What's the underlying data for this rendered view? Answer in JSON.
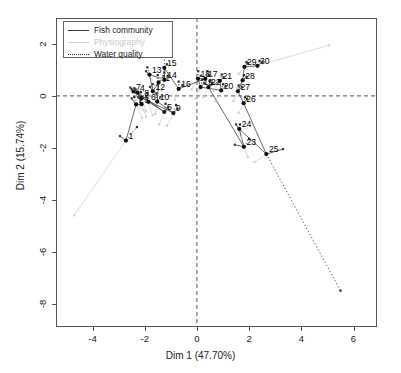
{
  "title": "",
  "axes": {
    "xlabel": "Dim 1 (47.70%)",
    "ylabel": "Dim 2 (15.74%)",
    "xticks": [
      -4,
      -2,
      0,
      2,
      4,
      6
    ],
    "yticks": [
      2,
      0,
      -2,
      -4,
      -6,
      -8
    ],
    "xlim": [
      -5.4,
      6.9
    ],
    "ylim": [
      -8.9,
      3.0
    ],
    "ref_lines": {
      "vertical_x": 0,
      "horizontal_y": 0,
      "style": "dashed"
    }
  },
  "legend": {
    "position": "top-left",
    "items": [
      {
        "label": "Fish community",
        "color": "#3a3a3a",
        "style": "solid"
      },
      {
        "label": "Physiography",
        "color": "#d2d2d2",
        "style": "solid"
      },
      {
        "label": "Water quality",
        "color": "#2b2b2b",
        "style": "dotted"
      }
    ]
  },
  "chart_data": {
    "type": "scatter",
    "title": "",
    "xlabel": "Dim 1 (47.70%)",
    "ylabel": "Dim 2 (15.74%)",
    "xlim": [
      -5.4,
      6.9
    ],
    "ylim": [
      -8.9,
      3.0
    ],
    "grid": false,
    "legend_position": "top-left",
    "series": [
      {
        "name": "Individuals (global)",
        "style": "labelled-points",
        "color": "#111111",
        "points": [
          {
            "label": "1",
            "x": -2.72,
            "y": -1.72
          },
          {
            "label": "2",
            "x": -2.33,
            "y": -0.33
          },
          {
            "label": "3",
            "x": -2.12,
            "y": -0.32
          },
          {
            "label": "4",
            "x": -2.28,
            "y": 0.13
          },
          {
            "label": "5",
            "x": -1.25,
            "y": -0.62
          },
          {
            "label": "6",
            "x": -1.86,
            "y": -0.23
          },
          {
            "label": "7",
            "x": -2.43,
            "y": 0.17
          },
          {
            "label": "8",
            "x": -2.12,
            "y": -0.08
          },
          {
            "label": "9",
            "x": -0.9,
            "y": -0.66
          },
          {
            "label": "10",
            "x": -1.52,
            "y": -0.22
          },
          {
            "label": "11",
            "x": -1.47,
            "y": 0.52
          },
          {
            "label": "12",
            "x": -1.69,
            "y": 0.18
          },
          {
            "label": "13",
            "x": -1.82,
            "y": 0.82
          },
          {
            "label": "14",
            "x": -1.24,
            "y": 0.62
          },
          {
            "label": "15",
            "x": -1.25,
            "y": 1.08
          },
          {
            "label": "16",
            "x": -0.7,
            "y": 0.27
          },
          {
            "label": "17",
            "x": 0.32,
            "y": 0.66
          },
          {
            "label": "18",
            "x": 0.04,
            "y": 0.66
          },
          {
            "label": "19",
            "x": 0.14,
            "y": 0.34
          },
          {
            "label": "20",
            "x": 0.93,
            "y": 0.21
          },
          {
            "label": "21",
            "x": 0.88,
            "y": 0.58
          },
          {
            "label": "22",
            "x": 0.44,
            "y": 0.34
          },
          {
            "label": "23",
            "x": 1.8,
            "y": -1.96
          },
          {
            "label": "24",
            "x": 1.62,
            "y": -1.27
          },
          {
            "label": "25",
            "x": 2.66,
            "y": -2.24
          },
          {
            "label": "26",
            "x": 1.79,
            "y": -0.28
          },
          {
            "label": "27",
            "x": 1.57,
            "y": 0.18
          },
          {
            "label": "28",
            "x": 1.75,
            "y": 0.6
          },
          {
            "label": "29",
            "x": 1.82,
            "y": 1.12
          },
          {
            "label": "30",
            "x": 2.32,
            "y": 1.16
          }
        ]
      },
      {
        "name": "Fish community",
        "style": "solid",
        "color": "#3a3a3a",
        "partial_points": [
          {
            "id": "1",
            "x": -2.95,
            "y": -1.55
          },
          {
            "id": "2",
            "x": -2.5,
            "y": -0.1
          },
          {
            "id": "3",
            "x": -2.25,
            "y": -0.05
          },
          {
            "id": "4",
            "x": -2.4,
            "y": 0.3
          },
          {
            "id": "5",
            "x": -1.1,
            "y": -0.45
          },
          {
            "id": "6",
            "x": -1.95,
            "y": 0.0
          },
          {
            "id": "7",
            "x": -2.55,
            "y": 0.32
          },
          {
            "id": "8",
            "x": -2.25,
            "y": 0.1
          },
          {
            "id": "9",
            "x": -0.75,
            "y": -0.5
          },
          {
            "id": "10",
            "x": -1.4,
            "y": -0.05
          },
          {
            "id": "11",
            "x": -1.32,
            "y": 0.68
          },
          {
            "id": "12",
            "x": -1.8,
            "y": 0.35
          },
          {
            "id": "13",
            "x": -1.95,
            "y": 0.95
          },
          {
            "id": "14",
            "x": -1.1,
            "y": 0.78
          },
          {
            "id": "15",
            "x": -1.15,
            "y": 1.22
          },
          {
            "id": "16",
            "x": -0.55,
            "y": 0.42
          },
          {
            "id": "17",
            "x": 0.45,
            "y": 0.8
          },
          {
            "id": "18",
            "x": 0.15,
            "y": 0.78
          },
          {
            "id": "19",
            "x": 0.28,
            "y": 0.5
          },
          {
            "id": "20",
            "x": 1.1,
            "y": 0.38
          },
          {
            "id": "21",
            "x": 1.02,
            "y": 0.72
          },
          {
            "id": "22",
            "x": 0.58,
            "y": 0.48
          },
          {
            "id": "23",
            "x": 1.45,
            "y": -1.88
          },
          {
            "id": "24",
            "x": 1.5,
            "y": -1.1
          },
          {
            "id": "25",
            "x": 3.3,
            "y": -2.05
          },
          {
            "id": "26",
            "x": 1.92,
            "y": -0.12
          },
          {
            "id": "27",
            "x": 1.72,
            "y": 0.34
          },
          {
            "id": "28",
            "x": 1.9,
            "y": 0.74
          },
          {
            "id": "29",
            "x": 1.95,
            "y": 1.26
          },
          {
            "id": "30",
            "x": 2.5,
            "y": 1.3
          }
        ]
      },
      {
        "name": "Physiography",
        "style": "solid",
        "color": "#d2d2d2",
        "partial_points": [
          {
            "id": "1",
            "x": -4.7,
            "y": -4.6
          },
          {
            "id": "2",
            "x": -2.1,
            "y": -0.85
          },
          {
            "id": "3",
            "x": -1.95,
            "y": -0.8
          },
          {
            "id": "4",
            "x": -2.05,
            "y": -0.55
          },
          {
            "id": "5",
            "x": -1.45,
            "y": -1.1
          },
          {
            "id": "6",
            "x": -1.7,
            "y": -0.75
          },
          {
            "id": "7",
            "x": -2.2,
            "y": -0.45
          },
          {
            "id": "8",
            "x": -1.95,
            "y": -0.6
          },
          {
            "id": "9",
            "x": -1.15,
            "y": -1.15
          },
          {
            "id": "10",
            "x": -1.6,
            "y": -0.7
          },
          {
            "id": "11",
            "x": -1.6,
            "y": 0.1
          },
          {
            "id": "12",
            "x": -1.55,
            "y": -0.25
          },
          {
            "id": "13",
            "x": -1.6,
            "y": 0.4
          },
          {
            "id": "14",
            "x": -1.35,
            "y": 0.2
          },
          {
            "id": "15",
            "x": -1.35,
            "y": 0.65
          },
          {
            "id": "16",
            "x": -0.85,
            "y": -0.15
          },
          {
            "id": "17",
            "x": 0.1,
            "y": 0.25
          },
          {
            "id": "18",
            "x": -0.2,
            "y": 0.25
          },
          {
            "id": "19",
            "x": -0.05,
            "y": -0.1
          },
          {
            "id": "20",
            "x": 0.7,
            "y": -0.2
          },
          {
            "id": "21",
            "x": 0.65,
            "y": 0.2
          },
          {
            "id": "22",
            "x": 0.25,
            "y": -0.05
          },
          {
            "id": "23",
            "x": 1.95,
            "y": -2.35
          },
          {
            "id": "24",
            "x": 1.7,
            "y": -1.6
          },
          {
            "id": "25",
            "x": 2.2,
            "y": -2.55
          },
          {
            "id": "26",
            "x": 1.6,
            "y": -0.65
          },
          {
            "id": "27",
            "x": 1.4,
            "y": -0.2
          },
          {
            "id": "28",
            "x": 1.55,
            "y": 0.3
          },
          {
            "id": "29",
            "x": 1.6,
            "y": 0.85
          },
          {
            "id": "30",
            "x": 5.05,
            "y": 1.95
          }
        ]
      },
      {
        "name": "Water quality",
        "style": "dotted",
        "color": "#2b2b2b",
        "partial_points": [
          {
            "id": "1",
            "x": -2.3,
            "y": -1.2
          },
          {
            "id": "2",
            "x": -2.4,
            "y": -0.05
          },
          {
            "id": "3",
            "x": -2.15,
            "y": -0.1
          },
          {
            "id": "4",
            "x": -2.35,
            "y": 0.25
          },
          {
            "id": "5",
            "x": -1.2,
            "y": -0.3
          },
          {
            "id": "6",
            "x": -1.9,
            "y": 0.1
          },
          {
            "id": "7",
            "x": -2.5,
            "y": 0.25
          },
          {
            "id": "8",
            "x": -2.15,
            "y": 0.15
          },
          {
            "id": "9",
            "x": -0.8,
            "y": -0.35
          },
          {
            "id": "10",
            "x": -1.55,
            "y": 0.1
          },
          {
            "id": "11",
            "x": -1.5,
            "y": 0.8
          },
          {
            "id": "12",
            "x": -1.7,
            "y": 0.45
          },
          {
            "id": "13",
            "x": -1.9,
            "y": 1.1
          },
          {
            "id": "14",
            "x": -1.25,
            "y": 0.9
          },
          {
            "id": "15",
            "x": -1.25,
            "y": 2.05
          },
          {
            "id": "16",
            "x": -0.7,
            "y": 0.55
          },
          {
            "id": "17",
            "x": 0.4,
            "y": 0.95
          },
          {
            "id": "18",
            "x": 0.05,
            "y": 0.95
          },
          {
            "id": "19",
            "x": 0.2,
            "y": 0.62
          },
          {
            "id": "20",
            "x": 1.0,
            "y": 0.45
          },
          {
            "id": "21",
            "x": 0.95,
            "y": 0.82
          },
          {
            "id": "22",
            "x": 0.5,
            "y": 0.58
          },
          {
            "id": "23",
            "x": 2.0,
            "y": -1.65
          },
          {
            "id": "24",
            "x": 1.65,
            "y": -1.1
          },
          {
            "id": "25",
            "x": 5.5,
            "y": -7.5
          },
          {
            "id": "26",
            "x": 1.85,
            "y": -0.05
          },
          {
            "id": "27",
            "x": 1.6,
            "y": 0.4
          },
          {
            "id": "28",
            "x": 1.8,
            "y": 0.8
          },
          {
            "id": "29",
            "x": 1.9,
            "y": 1.3
          },
          {
            "id": "30",
            "x": 2.4,
            "y": 1.35
          }
        ]
      }
    ]
  }
}
